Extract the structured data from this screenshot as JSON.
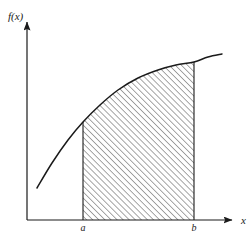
{
  "figure": {
    "type": "definite-integral-area-under-curve",
    "background_color": "#ffffff",
    "stroke_color": "#1a1a1a",
    "hatch_color": "#3a3a3a",
    "labels": {
      "y_axis": "f(x)",
      "x_axis": "x",
      "lower_limit": "a",
      "upper_limit": "b"
    },
    "font_sizes": {
      "y_axis": 11,
      "x_axis": 11,
      "limits": 10
    }
  },
  "chart_data": {
    "type": "line",
    "title": "",
    "subtitle": "",
    "xlabel": "x",
    "ylabel": "f(x)",
    "grid": false,
    "legend": "none",
    "axes": {
      "origin_px": [
        27,
        220
      ],
      "x_axis_end_px": [
        237,
        220
      ],
      "y_axis_top_px": [
        27,
        17
      ],
      "arrowheads": [
        "x-axis-right",
        "y-axis-top"
      ]
    },
    "curve": {
      "name": "f(x)",
      "shape": "concave-down increasing",
      "points_px": [
        [
          37,
          188
        ],
        [
          52,
          163
        ],
        [
          68,
          140
        ],
        [
          83,
          122
        ],
        [
          100,
          105
        ],
        [
          118,
          90
        ],
        [
          138,
          78
        ],
        [
          158,
          70
        ],
        [
          176,
          65
        ],
        [
          194,
          62
        ],
        [
          208,
          57
        ],
        [
          222,
          54
        ]
      ]
    },
    "shaded_region": {
      "label": "area under f(x) from a to b",
      "fill": "diagonal-hatch",
      "hatch_angle_deg": 45,
      "hatch_spacing_px": 4.3,
      "x_from_px": 83,
      "x_to_px": 194,
      "baseline_y_px": 220
    },
    "annotations": [
      {
        "text": "a",
        "x_px": 83,
        "y_px": 231
      },
      {
        "text": "b",
        "x_px": 194,
        "y_px": 231
      },
      {
        "text": "f(x)",
        "x_px": 8,
        "y_px": 20
      },
      {
        "text": "x",
        "x_px": 241,
        "y_px": 224
      }
    ],
    "x": [
      "a",
      "b"
    ],
    "values": [
      122,
      62
    ],
    "xlim": [
      27,
      237
    ],
    "ylim": [
      220,
      17
    ]
  }
}
